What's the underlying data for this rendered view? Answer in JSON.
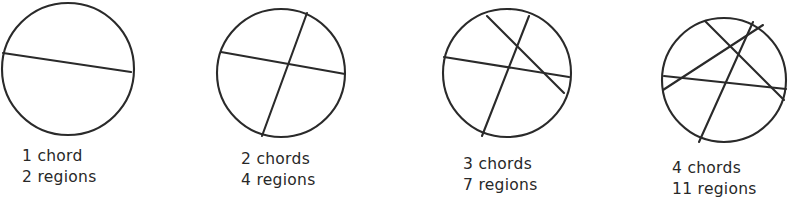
{
  "figure": {
    "width": 793,
    "height": 205,
    "background_color": "#ffffff",
    "ink_color": "#2a2a2a",
    "text_color": "#282828"
  },
  "panels": [
    {
      "id": "panel-1",
      "chords_label": "1 chord",
      "regions_label": "2 regions",
      "chord_count": 1,
      "region_count": 2,
      "caption_left": 22,
      "caption_top": 146,
      "circle": {
        "cx": 68,
        "cy": 69,
        "r": 66
      },
      "chords": [
        {
          "x1": 3,
          "y1": 53,
          "x2": 131,
          "y2": 72
        }
      ]
    },
    {
      "id": "panel-2",
      "chords_label": "2 chords",
      "regions_label": "4 regions",
      "chord_count": 2,
      "region_count": 4,
      "caption_left": 241,
      "caption_top": 149,
      "circle": {
        "cx": 281,
        "cy": 73,
        "r": 64
      },
      "chords": [
        {
          "x1": 307,
          "y1": 13,
          "x2": 262,
          "y2": 136
        },
        {
          "x1": 221,
          "y1": 52,
          "x2": 345,
          "y2": 74
        }
      ]
    },
    {
      "id": "panel-3",
      "chords_label": "3 chords",
      "regions_label": "7 regions",
      "chord_count": 3,
      "region_count": 7,
      "caption_left": 463,
      "caption_top": 154,
      "circle": {
        "cx": 507,
        "cy": 73,
        "r": 64
      },
      "chords": [
        {
          "x1": 487,
          "y1": 16,
          "x2": 564,
          "y2": 93
        },
        {
          "x1": 529,
          "y1": 16,
          "x2": 482,
          "y2": 136
        },
        {
          "x1": 444,
          "y1": 57,
          "x2": 569,
          "y2": 77
        }
      ]
    },
    {
      "id": "panel-4",
      "chords_label": "4 chords",
      "regions_label": "11 regions",
      "chord_count": 4,
      "region_count": 11,
      "caption_left": 672,
      "caption_top": 158,
      "circle": {
        "cx": 724,
        "cy": 80,
        "r": 62
      },
      "chords": [
        {
          "x1": 705,
          "y1": 21,
          "x2": 784,
          "y2": 100
        },
        {
          "x1": 753,
          "y1": 22,
          "x2": 699,
          "y2": 142
        },
        {
          "x1": 664,
          "y1": 76,
          "x2": 786,
          "y2": 89
        },
        {
          "x1": 663,
          "y1": 90,
          "x2": 763,
          "y2": 25
        }
      ]
    }
  ],
  "chart_data": {
    "type": "table",
    "columns": [
      "chords",
      "regions"
    ],
    "categories": [
      "1 chord",
      "2 chords",
      "3 chords",
      "4 chords"
    ],
    "series": [
      {
        "name": "chords",
        "values": [
          1,
          2,
          3,
          4
        ]
      },
      {
        "name": "regions",
        "values": [
          2,
          4,
          7,
          11
        ]
      }
    ],
    "xlabel": "number of chords",
    "ylabel": "number of regions",
    "annotations": [
      "1 chord / 2 regions",
      "2 chords / 4 regions",
      "3 chords / 7 regions",
      "4 chords / 11 regions"
    ]
  }
}
